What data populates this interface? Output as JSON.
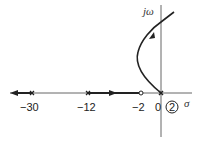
{
  "diagram": {
    "type": "root-locus",
    "axes": {
      "imag_label": "jω",
      "real_label": "σ"
    },
    "tick_labels": [
      "−30",
      "−12",
      "−2",
      "0"
    ],
    "poles": [
      -30,
      -12,
      0,
      0
    ],
    "zeros": [
      -2
    ],
    "multiplicity_label": "2",
    "colors": {
      "line": "#222222",
      "axis": "#555555"
    }
  }
}
